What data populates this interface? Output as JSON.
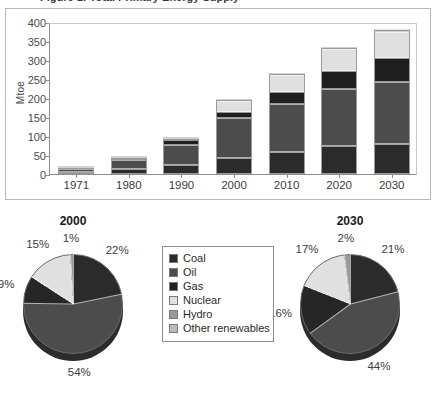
{
  "figure": {
    "cutoff_title": "Figure 1: Total Primary Energy Supply",
    "ylabel": "Mtoe"
  },
  "legend": {
    "items": [
      {
        "label": "Coal",
        "color": "#2b2b2b"
      },
      {
        "label": "Oil",
        "color": "#4c4c4c"
      },
      {
        "label": "Gas",
        "color": "#1f1f1f"
      },
      {
        "label": "Nuclear",
        "color": "#e0e0e0"
      },
      {
        "label": "Hydro",
        "color": "#9a9a9a"
      },
      {
        "label": "Other renewables",
        "color": "#bcbcbc"
      }
    ]
  },
  "chart_data": [
    {
      "type": "bar",
      "title": "Total primary energy supply by fuel",
      "stacked": true,
      "xlabel": "",
      "ylabel": "Mtoe",
      "ylim": [
        0,
        400
      ],
      "yticks": [
        0,
        50,
        100,
        150,
        200,
        250,
        300,
        350,
        400
      ],
      "grid": false,
      "legend_position": "center-bottom",
      "categories": [
        "1971",
        "1980",
        "1990",
        "2000",
        "2010",
        "2020",
        "2030"
      ],
      "series": [
        {
          "name": "Coal",
          "color": "#2b2b2b",
          "values": [
            5,
            14,
            25,
            42,
            58,
            75,
            80
          ]
        },
        {
          "name": "Oil",
          "color": "#4c4c4c",
          "values": [
            9,
            24,
            52,
            105,
            126,
            149,
            163
          ]
        },
        {
          "name": "Gas",
          "color": "#1f1f1f",
          "values": [
            1,
            3,
            12,
            17,
            33,
            47,
            62
          ]
        },
        {
          "name": "Nuclear",
          "color": "#e0e0e0",
          "values": [
            0,
            0,
            3,
            29,
            44,
            58,
            68
          ]
        },
        {
          "name": "Hydro",
          "color": "#9a9a9a",
          "values": [
            1,
            1,
            1,
            2,
            2,
            2,
            3
          ]
        },
        {
          "name": "Other renewables",
          "color": "#bcbcbc",
          "values": [
            0,
            0,
            0,
            0,
            0,
            0,
            2
          ]
        }
      ],
      "totals": [
        16,
        42,
        93,
        195,
        263,
        331,
        378
      ]
    },
    {
      "type": "pie",
      "title": "2000",
      "labels": [
        "Coal",
        "Oil",
        "Gas",
        "Nuclear",
        "Hydro"
      ],
      "values": [
        22,
        54,
        9,
        15,
        1
      ],
      "display_labels": [
        "22%",
        "54%",
        "9%",
        "15%",
        "1%"
      ],
      "colors": [
        "#2b2b2b",
        "#4c4c4c",
        "#262626",
        "#e0e0e0",
        "#9a9a9a"
      ]
    },
    {
      "type": "pie",
      "title": "2030",
      "labels": [
        "Coal",
        "Oil",
        "Gas",
        "Nuclear",
        "Hydro"
      ],
      "values": [
        21,
        44,
        16,
        17,
        2
      ],
      "display_labels": [
        "21%",
        "44%",
        "16%",
        "17%",
        "2%"
      ],
      "colors": [
        "#2b2b2b",
        "#4c4c4c",
        "#262626",
        "#e0e0e0",
        "#9a9a9a"
      ]
    }
  ]
}
